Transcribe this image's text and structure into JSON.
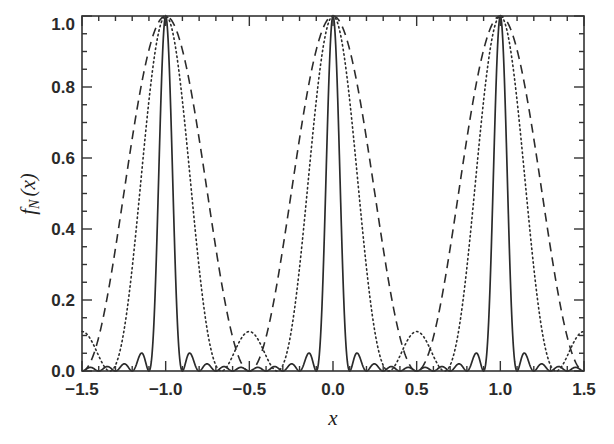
{
  "chart_data": {
    "type": "line",
    "title": "",
    "xlabel": "x",
    "ylabel": "f_N (x)",
    "ylabel_parts": {
      "main": "f",
      "sub": "N",
      "arg": "(x)"
    },
    "xlim": [
      -1.5,
      1.5
    ],
    "ylim": [
      0.0,
      1.0
    ],
    "grid": false,
    "legend": null,
    "x_ticks": [
      -1.5,
      -1.0,
      -0.5,
      0.0,
      0.5,
      1.0,
      1.5
    ],
    "x_tick_labels": [
      "−1.5",
      "−1.0",
      "−0.5",
      "0.0",
      "0.5",
      "1.0",
      "1.5"
    ],
    "x_minor_step": 0.1,
    "y_ticks": [
      0.0,
      0.2,
      0.4,
      0.6,
      0.8,
      1.0
    ],
    "y_tick_labels": [
      "0.0",
      "0.2",
      "0.4",
      "0.6",
      "0.8",
      "1.0"
    ],
    "y_minor_step": 0.05,
    "formula": "f_N(x) = [sin(Nπx) / (N sin(πx))]^2, periodic with period 1, peaks of 1 at integer x",
    "sample_x_half_period": [
      0.0,
      0.05,
      0.1,
      0.15,
      0.2,
      0.25,
      0.3,
      0.35,
      0.4,
      0.45,
      0.5
    ],
    "series": [
      {
        "name": "N=2",
        "N": 2,
        "style": "dashed",
        "values_half_period": [
          1.0,
          0.976,
          0.905,
          0.794,
          0.655,
          0.5,
          0.345,
          0.206,
          0.095,
          0.024,
          0.0
        ]
      },
      {
        "name": "N=3",
        "N": 3,
        "style": "dotted",
        "values_half_period": [
          1.0,
          0.936,
          0.762,
          0.526,
          0.291,
          0.111,
          0.016,
          0.003,
          0.042,
          0.09,
          0.111
        ]
      },
      {
        "name": "N=10",
        "N": 10,
        "style": "solid",
        "values_half_period": [
          1.0,
          0.409,
          0.0,
          0.049,
          0.0,
          0.02,
          0.0,
          0.013,
          0.0,
          0.01,
          0.0
        ]
      }
    ]
  }
}
